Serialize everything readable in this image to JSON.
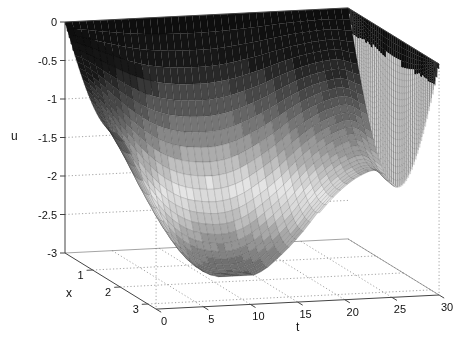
{
  "figure": {
    "width": 466,
    "height": 347,
    "background": "#ffffff"
  },
  "axes": {
    "u": {
      "label": "u",
      "tick_labels": [
        "0",
        "-0.5",
        "-1",
        "-1.5",
        "-2",
        "-2.5",
        "-3"
      ],
      "tick_values": [
        0,
        -0.5,
        -1,
        -1.5,
        -2,
        -2.5,
        -3
      ],
      "min": -3,
      "max": 0
    },
    "x": {
      "label": "x",
      "tick_labels": [
        "1",
        "2",
        "3"
      ],
      "tick_values": [
        1,
        2,
        3
      ],
      "min": 0,
      "max": 3.3
    },
    "t": {
      "label": "t",
      "tick_labels": [
        "0",
        "5",
        "10",
        "15",
        "20",
        "25",
        "30"
      ],
      "tick_values": [
        0,
        5,
        10,
        15,
        20,
        25,
        30
      ],
      "min": 0,
      "max": 30
    }
  },
  "chart_data": {
    "type": "surface",
    "title": "",
    "xlabel": "t",
    "ylabel": "x",
    "zlabel": "u",
    "x_range": [
      0,
      3.3
    ],
    "t_range": [
      0,
      30
    ],
    "u_range": [
      -3,
      0
    ],
    "surface_model": "u(x,t) = -depth(t) * sin(pi*x/3.3)",
    "depth_sample_t": [
      0,
      2,
      4,
      6,
      8,
      10,
      12,
      14,
      16,
      18,
      20,
      22,
      24,
      26,
      28,
      30
    ],
    "depth_values": [
      1.05,
      1.45,
      1.95,
      2.4,
      2.75,
      2.95,
      3.03,
      3.04,
      2.95,
      2.75,
      2.5,
      2.2,
      1.95,
      1.78,
      1.72,
      1.95
    ],
    "deepest_point": {
      "t": 13,
      "u": -3.0
    },
    "local_high_after_valley": {
      "t": 27,
      "u": -1.75
    },
    "end_walls_at_t": [
      0,
      30
    ],
    "grid": "dotted",
    "legend": "none",
    "colormap_grayscale_stops": [
      [
        0,
        0.05
      ],
      [
        0.55,
        0.09
      ],
      [
        0.9,
        0.26
      ],
      [
        1.3,
        0.45
      ],
      [
        1.7,
        0.68
      ],
      [
        2.05,
        0.9
      ],
      [
        2.35,
        0.8
      ],
      [
        2.65,
        0.6
      ],
      [
        2.9,
        0.46
      ],
      [
        3.05,
        0.37
      ]
    ]
  },
  "render": {
    "origin": [
      65,
      253
    ],
    "ex": [
      27.6,
      17
    ],
    "et": [
      9.433,
      -0.47
    ],
    "u_px": 77,
    "mesh_nx": 46,
    "mesh_nt": 40,
    "curtain_cols": 48,
    "curtain_rows": 22,
    "band_step": 0.125,
    "curtain_cap_depth": 0.3,
    "colors": {
      "axis": "#444444",
      "box_edge": "#666666",
      "grid": "#999999",
      "tick_label": "#111111",
      "curtain_fill": "#dcdcdc",
      "curtain_cap": "#0f0f0f",
      "mesh_line": "rgba(0,0,0,0.28)",
      "curtain_line": "rgba(0,0,0,0.5)"
    }
  }
}
